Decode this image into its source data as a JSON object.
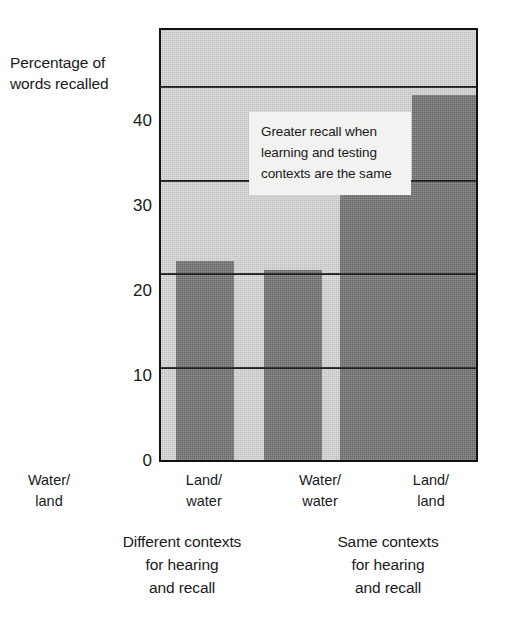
{
  "chart_data": {
    "type": "bar",
    "title": "",
    "xlabel": "",
    "ylabel": "Percentage of words recalled",
    "ylabel_lines": [
      "Percentage of",
      "words recalled"
    ],
    "categories": [
      "Water/land",
      "Land/water",
      "Water/water",
      "Land/land"
    ],
    "category_lines": [
      [
        "Water/",
        "land"
      ],
      [
        "Land/",
        "water"
      ],
      [
        "Water/",
        "water"
      ],
      [
        "Land/",
        "land"
      ]
    ],
    "values": [
      21.3,
      20.3,
      30.0,
      39.0
    ],
    "ylim": [
      0,
      46
    ],
    "yticks": [
      0,
      10,
      20,
      30,
      40
    ],
    "ytick_labels": [
      "0",
      "10",
      "20",
      "30",
      "40"
    ],
    "grid": true,
    "legend": "none",
    "bar_color": "#6e6e6e",
    "plot_background": "#d2d2d2",
    "axis_color": "#111111",
    "annotations": [
      {
        "text": "Greater recall when learning and testing contexts are the same",
        "lines": [
          "Greater recall when",
          "learning and testing",
          "contexts are the same"
        ]
      }
    ],
    "groups": [
      {
        "label": "Different contexts for hearing and recall",
        "lines": [
          "Different contexts",
          "for hearing",
          "and recall"
        ],
        "categories": [
          "Water/land",
          "Land/water"
        ]
      },
      {
        "label": "Same contexts for hearing and recall",
        "lines": [
          "Same contexts",
          "for hearing",
          "and recall"
        ],
        "categories": [
          "Water/water",
          "Land/land"
        ]
      }
    ]
  }
}
